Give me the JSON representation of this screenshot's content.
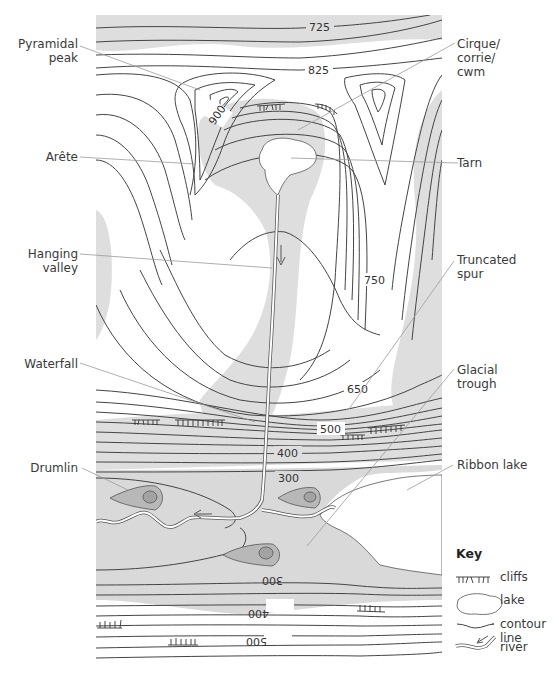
{
  "figure": {
    "map_colors": {
      "background": "#ffffff",
      "shading": "#dedede",
      "lowland_shading": "#d9d9d9",
      "drumlin_outer": "#b8b8b8",
      "drumlin_inner": "#a3a3a3",
      "lake": "#ffffff",
      "contour": "#444444",
      "leader_line": "#9a9a9a"
    },
    "contour_labels": {
      "c725": "725",
      "c825": "825",
      "c900": "900",
      "c750": "750",
      "c650": "650",
      "c500": "500",
      "c400": "400",
      "c300": "300",
      "c300_lower": "300",
      "c400_lower": "400",
      "c500_lower": "500"
    },
    "labels": {
      "pyramidal_peak": "Pyramidal\npeak",
      "arete": "Arête",
      "hanging_valley": "Hanging\nvalley",
      "waterfall": "Waterfall",
      "drumlin": "Drumlin",
      "cirque": "Cirque/\ncorrie/\ncwm",
      "tarn": "Tarn",
      "truncated_spur": "Truncated\nspur",
      "glacial_trough": "Glacial\ntrough",
      "ribbon_lake": "Ribbon lake"
    },
    "key": {
      "title": "Key",
      "items": [
        {
          "symbol": "cliffs-icon",
          "label": "cliffs"
        },
        {
          "symbol": "lake-icon",
          "label": "lake"
        },
        {
          "symbol": "contour-line-icon",
          "label": "contour line"
        },
        {
          "symbol": "river-icon",
          "label": "river"
        }
      ]
    }
  }
}
